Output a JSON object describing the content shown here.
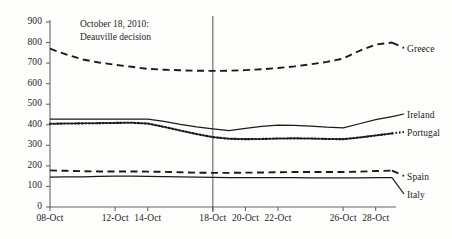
{
  "chart_data": {
    "type": "line",
    "title": "",
    "xlabel": "",
    "ylabel": "",
    "ylim": [
      0,
      900
    ],
    "ytick_values": [
      0,
      100,
      200,
      300,
      400,
      500,
      600,
      700,
      800,
      900
    ],
    "ytick_labels": [
      "0",
      "100",
      "200",
      "300",
      "400",
      "500",
      "600",
      "700",
      "800",
      "900"
    ],
    "grid": false,
    "legend_position": "right-inline-labels",
    "x": [
      "08-Oct",
      "09-Oct",
      "10-Oct",
      "11-Oct",
      "12-Oct",
      "13-Oct",
      "14-Oct",
      "15-Oct",
      "16-Oct",
      "17-Oct",
      "18-Oct",
      "19-Oct",
      "20-Oct",
      "21-Oct",
      "22-Oct",
      "23-Oct",
      "24-Oct",
      "25-Oct",
      "26-Oct",
      "27-Oct",
      "28-Oct",
      "29-Oct"
    ],
    "xtick_labels": [
      "08-Oct",
      "12-Oct",
      "14-Oct",
      "18-Oct",
      "20-Oct",
      "22-Oct",
      "26-Oct",
      "28-Oct"
    ],
    "xtick_indices": [
      0,
      4,
      6,
      10,
      12,
      14,
      18,
      20
    ],
    "series": [
      {
        "name": "Greece",
        "style": "dashed",
        "values": [
          770,
          742,
          718,
          703,
          692,
          682,
          672,
          668,
          665,
          663,
          662,
          663,
          666,
          670,
          676,
          684,
          694,
          706,
          722,
          760,
          790,
          800
        ]
      },
      {
        "name": "Ireland",
        "style": "solid",
        "values": [
          428,
          427,
          427,
          427,
          427,
          428,
          428,
          416,
          402,
          390,
          380,
          371,
          382,
          392,
          398,
          397,
          393,
          388,
          385,
          405,
          425,
          440
        ]
      },
      {
        "name": "Portugal",
        "style": "dotted",
        "values": [
          405,
          406,
          407,
          408,
          409,
          410,
          406,
          390,
          372,
          355,
          340,
          332,
          330,
          331,
          333,
          334,
          333,
          331,
          330,
          338,
          348,
          358
        ]
      },
      {
        "name": "Spain",
        "style": "dashed",
        "values": [
          178,
          176,
          174,
          173,
          173,
          173,
          172,
          171,
          169,
          167,
          166,
          166,
          167,
          168,
          169,
          170,
          170,
          170,
          170,
          172,
          175,
          177
        ]
      },
      {
        "name": "Italy",
        "style": "solid",
        "values": [
          145,
          146,
          147,
          149,
          150,
          150,
          149,
          148,
          146,
          145,
          144,
          143,
          143,
          143,
          143,
          143,
          142,
          142,
          142,
          142,
          143,
          143
        ]
      }
    ],
    "annotations": [
      {
        "name": "deauville-annotation",
        "line1": "October 18, 2010:",
        "line2": "Deauville decision",
        "vline_at": "18-Oct"
      }
    ],
    "colors": {
      "line": "#1a1a1a",
      "axis": "#666666",
      "background": "#fdfdfc",
      "text": "#1c1c1c"
    }
  }
}
